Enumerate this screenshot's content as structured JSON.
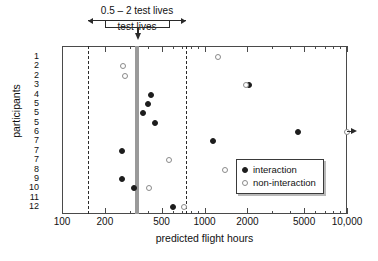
{
  "chart_data": {
    "type": "scatter",
    "title": "",
    "xlabel": "predicted flight hours",
    "ylabel": "participants",
    "xscale": "log",
    "xlim": [
      100,
      10000
    ],
    "xticks": [
      100,
      200,
      500,
      1000,
      2000,
      5000,
      10000
    ],
    "xticklabels": [
      "100",
      "200",
      "500",
      "1000",
      "2000",
      "5000",
      "10,000"
    ],
    "grid": false,
    "legend_position": "middle-right",
    "categories": [
      "1",
      "2",
      "2",
      "3",
      "4",
      "5",
      "5",
      "5",
      "6",
      "7",
      "7",
      "7",
      "8",
      "9",
      "10",
      "11",
      "12"
    ],
    "series": [
      {
        "name": "interaction",
        "marker": "filled-circle",
        "color": "#1d1d1d",
        "points": [
          {
            "row": 3,
            "participant": "3",
            "x": 2050
          },
          {
            "row": 4,
            "participant": "4",
            "x": 420
          },
          {
            "row": 5,
            "participant": "5",
            "x": 400
          },
          {
            "row": 6,
            "participant": "5",
            "x": 370
          },
          {
            "row": 7,
            "participant": "5",
            "x": 450
          },
          {
            "row": 8,
            "participant": "6",
            "x": 4500
          },
          {
            "row": 9,
            "participant": "7",
            "x": 1150
          },
          {
            "row": 10,
            "participant": "7",
            "x": 265
          },
          {
            "row": 13,
            "participant": "9",
            "x": 265
          },
          {
            "row": 14,
            "participant": "10",
            "x": 320
          },
          {
            "row": 16,
            "participant": "12",
            "x": 600
          }
        ]
      },
      {
        "name": "non-interaction",
        "marker": "open-circle",
        "color": "#8a8a8a",
        "points": [
          {
            "row": 0,
            "participant": "1",
            "x": 1250
          },
          {
            "row": 1,
            "participant": "2",
            "x": 270
          },
          {
            "row": 2,
            "participant": "2",
            "x": 275
          },
          {
            "row": 3,
            "participant": "3",
            "x": 1950
          },
          {
            "row": 8,
            "participant": "6",
            "x": 10000,
            "offscale": true
          },
          {
            "row": 11,
            "participant": "7",
            "x": 560
          },
          {
            "row": 12,
            "participant": "8",
            "x": 1400
          },
          {
            "row": 14,
            "participant": "10",
            "x": 410
          },
          {
            "row": 16,
            "participant": "12",
            "x": 720
          }
        ]
      }
    ],
    "annotations": {
      "upper_band_label": "0.5 – 2 test lives",
      "upper_band_range": [
        200,
        850
      ],
      "lower_band_label": "test lives",
      "lower_band_range": [
        200,
        850
      ],
      "nominal_marker_value": 430,
      "reference_lines": [
        {
          "value": 210,
          "style": "dashed"
        },
        {
          "value": 850,
          "style": "dashed"
        },
        {
          "value": 430,
          "style": "solid-gray-band"
        }
      ],
      "offscale_arrow": "points right beyond 10,000"
    }
  },
  "legend": {
    "items": [
      {
        "label": "interaction",
        "marker": "filled-circle"
      },
      {
        "label": "non-interaction",
        "marker": "open-circle"
      }
    ]
  }
}
